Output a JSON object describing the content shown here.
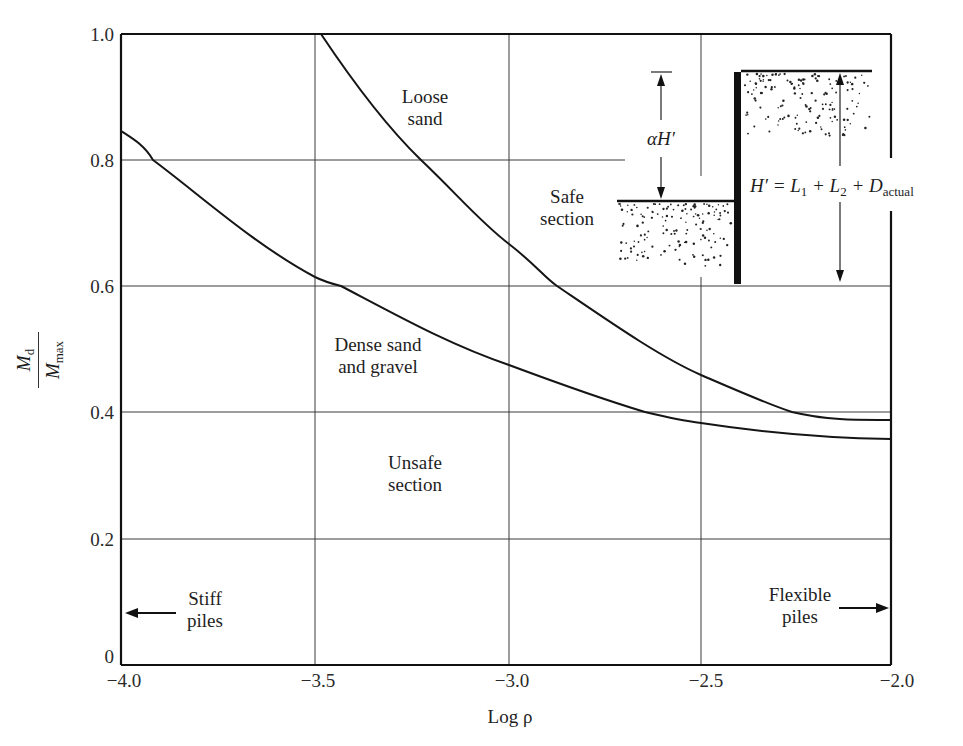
{
  "chart_data": {
    "type": "line",
    "title": "",
    "xlabel": "Log ρ",
    "ylabel": "M_d / M_max",
    "xlim": [
      -4.0,
      -2.0
    ],
    "ylim": [
      0,
      1.0
    ],
    "grid": true,
    "x_ticks": [
      "−4.0",
      "−3.5",
      "−3.0",
      "−2.5",
      "−2.0"
    ],
    "y_ticks": [
      "0",
      "0.2",
      "0.4",
      "0.6",
      "0.8",
      "1.0"
    ],
    "series": [
      {
        "name": "Loose sand",
        "x": [
          -3.48,
          -3.4,
          -3.3,
          -3.23,
          -3.1,
          -3.0,
          -2.88,
          -2.75,
          -2.6,
          -2.5,
          -2.4,
          -2.26,
          -2.15,
          -2.0
        ],
        "y": [
          1.0,
          0.93,
          0.855,
          0.8,
          0.72,
          0.667,
          0.6,
          0.545,
          0.49,
          0.46,
          0.435,
          0.4,
          0.39,
          0.387
        ]
      },
      {
        "name": "Dense sand and gravel",
        "x": [
          -4.0,
          -3.92,
          -3.8,
          -3.7,
          -3.6,
          -3.5,
          -3.43,
          -3.3,
          -3.2,
          -3.1,
          -3.0,
          -2.85,
          -2.65,
          -2.5,
          -2.35,
          -2.2,
          -2.1,
          -2.0
        ],
        "y": [
          0.847,
          0.8,
          0.755,
          0.715,
          0.67,
          0.625,
          0.6,
          0.565,
          0.535,
          0.51,
          0.485,
          0.45,
          0.4,
          0.385,
          0.372,
          0.363,
          0.36,
          0.36
        ]
      }
    ],
    "annotations": [
      {
        "text": "Loose sand",
        "x": -3.15,
        "y": 0.89
      },
      {
        "text": "Safe section",
        "x": -2.77,
        "y": 0.71
      },
      {
        "text": "Dense sand and gravel",
        "x": -3.1,
        "y": 0.485
      },
      {
        "text": "Unsafe section",
        "x": -3.07,
        "y": 0.315
      },
      {
        "text": "Stiff piles",
        "arrow": "left",
        "x": -3.8,
        "y": 0.08
      },
      {
        "text": "Flexible piles",
        "arrow": "right",
        "x": -2.2,
        "y": 0.08
      }
    ],
    "inset": {
      "description": "Sheet pile wall with backfill and dredge line",
      "label_alpha": "αH′",
      "label_height": "H′ = L1 + L2 + D_actual"
    }
  },
  "labels": {
    "loose_sand": [
      "Loose",
      "sand"
    ],
    "safe_section": [
      "Safe",
      "section"
    ],
    "dense_sand": [
      "Dense sand",
      "and gravel"
    ],
    "unsafe_section": [
      "Unsafe",
      "section"
    ],
    "stiff_piles": [
      "Stiff",
      "piles"
    ],
    "flexible_piles": [
      "Flexible",
      "piles"
    ],
    "alpha_h": "αH′",
    "h_eq_main": "H′ = L",
    "h_eq_sub1": "1",
    "h_eq_plus1": " + L",
    "h_eq_sub2": "2",
    "h_eq_plus2": " + D",
    "h_eq_sub3": "actual",
    "x_axis_label": "Log ρ",
    "y_num": "M",
    "y_num_sub": "d",
    "y_den": "M",
    "y_den_sub": "max"
  },
  "ticks": {
    "x": [
      "−4.0",
      "−3.5",
      "−3.0",
      "−2.5",
      "−2.0"
    ],
    "y": [
      "1.0",
      "0.8",
      "0.6",
      "0.4",
      "0.2",
      "0"
    ]
  }
}
